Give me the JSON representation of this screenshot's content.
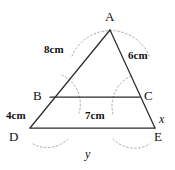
{
  "figure": {
    "kind": "geometry-diagram",
    "stroke_color": "#2b2b2b",
    "arc_color": "#9a9a9a",
    "background_color": "#ffffff",
    "vertices": [
      {
        "id": "A",
        "label": "A",
        "x": 110,
        "y": 30
      },
      {
        "id": "B",
        "label": "B",
        "x": 50,
        "y": 97
      },
      {
        "id": "C",
        "label": "C",
        "x": 140,
        "y": 97
      },
      {
        "id": "D",
        "label": "D",
        "x": 30,
        "y": 128
      },
      {
        "id": "E",
        "label": "E",
        "x": 155,
        "y": 128
      }
    ],
    "vertex_label_positions": [
      {
        "id": "A",
        "label": "A",
        "left": 105,
        "top": 10
      },
      {
        "id": "B",
        "label": "B",
        "left": 33,
        "top": 89
      },
      {
        "id": "C",
        "label": "C",
        "left": 144,
        "top": 89
      },
      {
        "id": "D",
        "label": "D",
        "left": 9,
        "top": 130
      },
      {
        "id": "E",
        "label": "E",
        "left": 154,
        "top": 130
      }
    ],
    "segments": [
      {
        "id": "AD",
        "from": "A",
        "to": "D"
      },
      {
        "id": "AE",
        "from": "A",
        "to": "E"
      },
      {
        "id": "BC",
        "from": "B",
        "to": "C"
      },
      {
        "id": "DE",
        "from": "D",
        "to": "E"
      }
    ],
    "measure_labels": [
      {
        "id": "AB",
        "text": "8cm",
        "left": 44,
        "top": 44
      },
      {
        "id": "AC",
        "text": "6cm",
        "left": 128,
        "top": 50
      },
      {
        "id": "BD",
        "text": "4cm",
        "left": 6,
        "top": 110
      },
      {
        "id": "BC",
        "text": "7cm",
        "left": 85,
        "top": 110
      }
    ],
    "variable_labels": [
      {
        "id": "CE",
        "text": "x",
        "left": 159,
        "top": 113
      },
      {
        "id": "DE",
        "text": "y",
        "left": 85,
        "top": 148
      }
    ]
  }
}
